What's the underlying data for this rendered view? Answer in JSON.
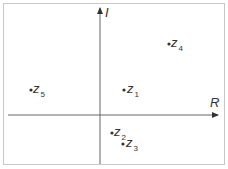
{
  "axes": {
    "real_label": "R",
    "imag_label": "I"
  },
  "points": [
    {
      "name": "z",
      "sub": "1",
      "x": 125,
      "y": 89
    },
    {
      "name": "z",
      "sub": "2",
      "x": 112,
      "y": 132
    },
    {
      "name": "z",
      "sub": "3",
      "x": 123,
      "y": 143
    },
    {
      "name": "z",
      "sub": "4",
      "x": 169,
      "y": 43
    },
    {
      "name": "z",
      "sub": "5",
      "x": 31,
      "y": 89
    }
  ],
  "colors": {
    "axis": "#666666",
    "point": "#333333",
    "frame": "#c8c8c8"
  }
}
